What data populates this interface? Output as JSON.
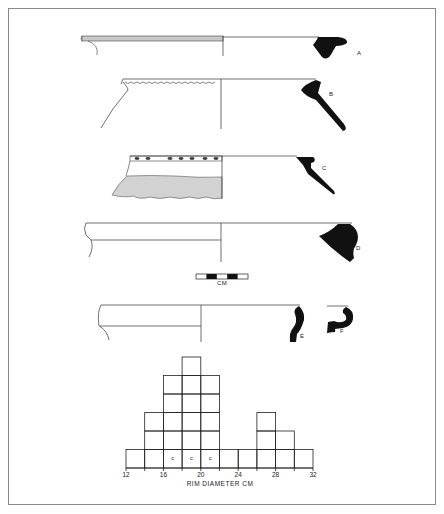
{
  "figure": {
    "profiles": [
      {
        "id": "A",
        "label": "A"
      },
      {
        "id": "B",
        "label": "B"
      },
      {
        "id": "C",
        "label": "C"
      },
      {
        "id": "D",
        "label": "D"
      },
      {
        "id": "E",
        "label": "E"
      },
      {
        "id": "F",
        "label": "F"
      }
    ],
    "scale_bar": {
      "label": "CM"
    }
  },
  "chart_data": {
    "type": "bar",
    "title": "",
    "xlabel": "RIM DIAMETER CM",
    "ylabel": "",
    "bins": [
      [
        12,
        14
      ],
      [
        14,
        16
      ],
      [
        16,
        18
      ],
      [
        18,
        20
      ],
      [
        20,
        22
      ],
      [
        22,
        24
      ],
      [
        24,
        26
      ],
      [
        26,
        28
      ],
      [
        28,
        30
      ],
      [
        30,
        32
      ]
    ],
    "categories": [
      "12-14",
      "14-16",
      "16-18",
      "18-20",
      "20-22",
      "22-24",
      "24-26",
      "26-28",
      "28-30",
      "30-32"
    ],
    "values": [
      1,
      3,
      5,
      6,
      5,
      1,
      1,
      3,
      2,
      1
    ],
    "x_ticks": [
      "12",
      "16",
      "20",
      "24",
      "28",
      "32"
    ],
    "xlim": [
      12,
      32
    ],
    "ylim": [
      0,
      6
    ],
    "grid": false,
    "style": "stacked unit squares",
    "annotations": [
      {
        "bin": "16-18",
        "row": 1,
        "text": "c"
      },
      {
        "bin": "18-20",
        "row": 1,
        "text": "c"
      },
      {
        "bin": "20-22",
        "row": 1,
        "text": "c"
      }
    ]
  }
}
